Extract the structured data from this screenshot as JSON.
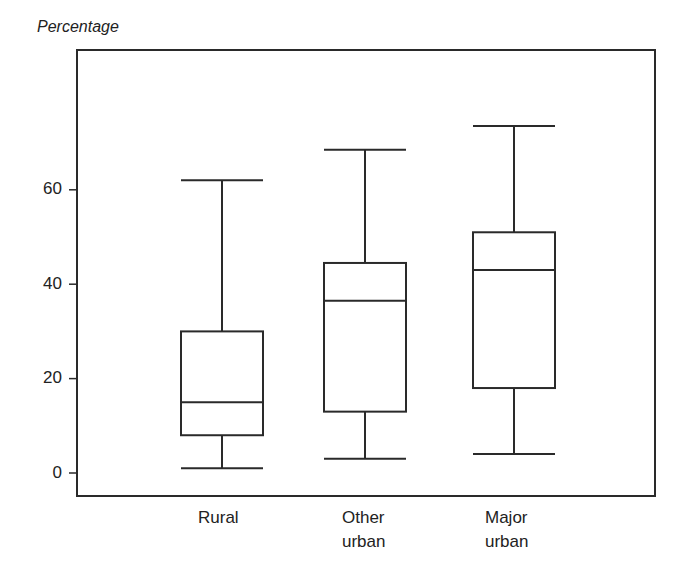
{
  "chart_data": {
    "type": "boxplot",
    "title": "",
    "ylabel": "Percentage",
    "xlabel": "",
    "ylim": [
      -5,
      82
    ],
    "yticks": [
      0,
      20,
      40,
      60
    ],
    "grid": false,
    "legend": null,
    "categories": [
      "Rural",
      "Other urban",
      "Major urban"
    ],
    "category_label_lines": [
      [
        "Rural"
      ],
      [
        "Other",
        "urban"
      ],
      [
        "Major",
        "urban"
      ]
    ],
    "series": [
      {
        "name": "Rural",
        "min": 1,
        "q1": 8,
        "median": 15,
        "q3": 30,
        "max": 62
      },
      {
        "name": "Other urban",
        "min": 3,
        "q1": 13,
        "median": 36.5,
        "q3": 44.5,
        "max": 68.5
      },
      {
        "name": "Major urban",
        "min": 4,
        "q1": 18,
        "median": 43,
        "q3": 51,
        "max": 73.5
      }
    ],
    "line_color": "#2a2a2a"
  },
  "labels": {
    "y_axis_title": "Percentage",
    "yticks": [
      "0",
      "20",
      "40",
      "60"
    ],
    "cat_0_line1": "Rural",
    "cat_1_line1": "Other",
    "cat_1_line2": "urban",
    "cat_2_line1": "Major",
    "cat_2_line2": "urban"
  }
}
